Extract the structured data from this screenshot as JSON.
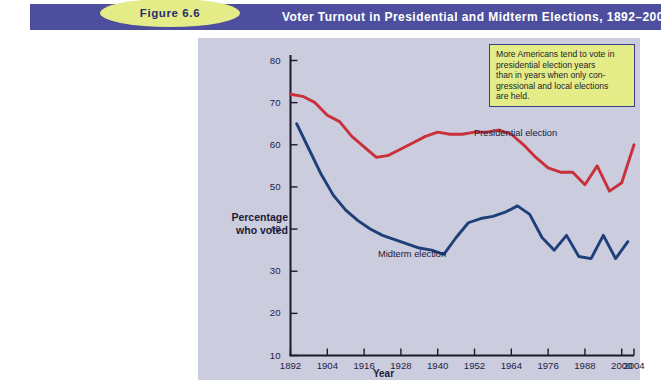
{
  "header": {
    "figure_label": "Figure 6.6",
    "title": "Voter Turnout in Presidential and Midterm Elections, 1892–2004",
    "banner_color": "#4d4f9e",
    "pill_color": "#e3ec86"
  },
  "callout": {
    "lines": [
      "More Americans tend to vote in",
      "presidential election years",
      "than in years when only con-",
      "gressional and local elections",
      "are held."
    ],
    "background": "#e3ec86",
    "border_color": "#3a3c86"
  },
  "annotations": {
    "presidential": "Presidential election",
    "midterm": "Midterm election"
  },
  "chart_data": {
    "type": "line",
    "title": "Voter Turnout in Presidential and Midterm Elections, 1892–2004",
    "xlabel": "Year",
    "ylabel": "Percentage who voted",
    "ylabel_lines": [
      "Percentage",
      "who voted"
    ],
    "xlim": [
      1892,
      2004
    ],
    "ylim": [
      10,
      80
    ],
    "yticks": [
      80,
      70,
      60,
      50,
      40,
      30,
      20,
      10
    ],
    "xticks": [
      1892,
      1904,
      1916,
      1928,
      1940,
      1952,
      1964,
      1976,
      1988,
      2000,
      2004
    ],
    "grid": false,
    "legend_position": "inline-annotations",
    "plot_background": "#ccccdf",
    "series": [
      {
        "name": "Presidential election",
        "color": "#c8303a",
        "x": [
          1892,
          1896,
          1900,
          1904,
          1908,
          1912,
          1916,
          1920,
          1924,
          1928,
          1932,
          1936,
          1940,
          1944,
          1948,
          1952,
          1956,
          1960,
          1964,
          1968,
          1972,
          1976,
          1980,
          1984,
          1988,
          1992,
          1996,
          2000,
          2004
        ],
        "y": [
          72,
          71.5,
          70,
          67,
          65.5,
          62,
          59.5,
          57,
          57.5,
          59,
          60.5,
          62,
          63,
          62.5,
          62.5,
          63,
          63,
          63.5,
          62.5,
          60,
          57,
          54.5,
          53.5,
          53.5,
          50.5,
          55,
          49,
          51,
          60
        ]
      },
      {
        "name": "Midterm election",
        "color": "#1e3f78",
        "x": [
          1894,
          1898,
          1902,
          1906,
          1910,
          1914,
          1918,
          1922,
          1926,
          1930,
          1934,
          1938,
          1942,
          1946,
          1950,
          1954,
          1958,
          1962,
          1966,
          1970,
          1974,
          1978,
          1982,
          1986,
          1990,
          1994,
          1998,
          2002
        ],
        "y": [
          65,
          59,
          53,
          48,
          44.5,
          42,
          40,
          38.5,
          37.5,
          36.5,
          35.5,
          35,
          34,
          38,
          41.5,
          42.5,
          43,
          44,
          45.5,
          43.5,
          38,
          35,
          38.5,
          33.5,
          33,
          38.5,
          33,
          37
        ]
      }
    ]
  }
}
